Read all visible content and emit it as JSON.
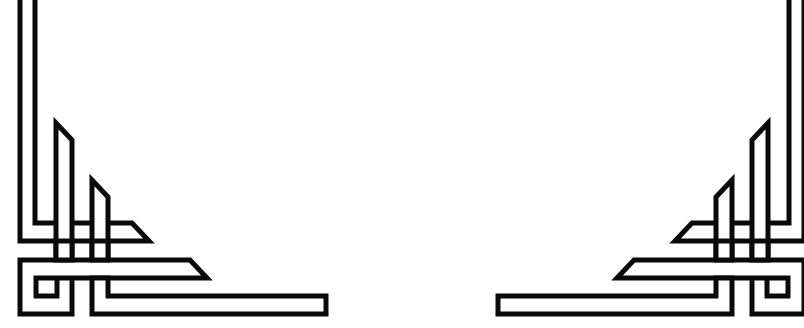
{
  "image": {
    "description": "Decorative interlaced Celtic/Art-Deco style corner ornaments on a white background",
    "background_color": "#ffffff",
    "stroke_color": "#0a0a0a",
    "ornaments": [
      {
        "name": "left-corner-ornament",
        "position": "bottom-left"
      },
      {
        "name": "right-corner-ornament",
        "position": "bottom-right",
        "mirrored": true
      }
    ]
  }
}
